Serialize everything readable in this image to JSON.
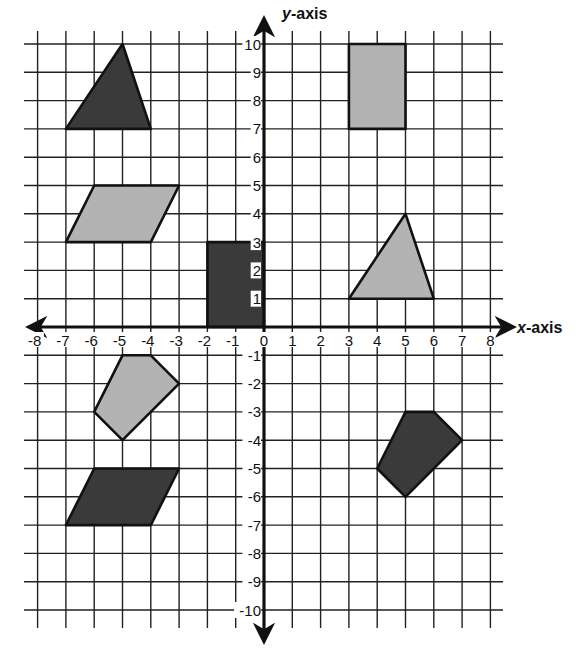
{
  "figure": {
    "x_axis_label": {
      "var": "x",
      "rest": "-axis"
    },
    "y_axis_label": {
      "var": "y",
      "rest": "-axis"
    },
    "x_range": [
      -8,
      8
    ],
    "y_range": [
      -10,
      10
    ],
    "x_tick_labels": [
      "-8",
      "-7",
      "-6",
      "-5",
      "-4",
      "-3",
      "-2",
      "-1",
      "0",
      "1",
      "2",
      "3",
      "4",
      "5",
      "6",
      "7",
      "8"
    ],
    "y_tick_labels_positive": [
      "1",
      "2",
      "3",
      "4",
      "5",
      "6",
      "7",
      "8",
      "9",
      "10"
    ],
    "y_tick_labels_negative": [
      "-1",
      "-2",
      "-3",
      "-4",
      "-5",
      "-6",
      "-7",
      "-8",
      "-9",
      "-10"
    ],
    "colors": {
      "dark_fill": "#3a3a3a",
      "light_fill": "#b3b3b3",
      "grid": "#222222"
    }
  },
  "shapes": [
    {
      "name": "dark-triangle-top-left",
      "fill": "dark",
      "vertices": [
        [
          -7,
          7
        ],
        [
          -5,
          10
        ],
        [
          -4,
          7
        ]
      ]
    },
    {
      "name": "light-rectangle-top-right",
      "fill": "light",
      "vertices": [
        [
          3,
          7
        ],
        [
          3,
          10
        ],
        [
          5,
          10
        ],
        [
          5,
          7
        ]
      ]
    },
    {
      "name": "light-parallelogram-left",
      "fill": "light",
      "vertices": [
        [
          -7,
          3
        ],
        [
          -6,
          5
        ],
        [
          -3,
          5
        ],
        [
          -4,
          3
        ]
      ]
    },
    {
      "name": "dark-rectangle-center",
      "fill": "dark",
      "vertices": [
        [
          -2,
          0
        ],
        [
          -2,
          3
        ],
        [
          0,
          3
        ],
        [
          0,
          0
        ]
      ]
    },
    {
      "name": "light-triangle-right",
      "fill": "light",
      "vertices": [
        [
          3,
          1
        ],
        [
          5,
          4
        ],
        [
          6,
          1
        ]
      ]
    },
    {
      "name": "light-pentagon-bottom-left",
      "fill": "light",
      "vertices": [
        [
          -5,
          -1
        ],
        [
          -4,
          -1
        ],
        [
          -3,
          -2
        ],
        [
          -5,
          -4
        ],
        [
          -6,
          -3
        ]
      ]
    },
    {
      "name": "dark-parallelogram-bottom-left",
      "fill": "dark",
      "vertices": [
        [
          -7,
          -7
        ],
        [
          -6,
          -5
        ],
        [
          -3,
          -5
        ],
        [
          -4,
          -7
        ]
      ]
    },
    {
      "name": "dark-pentagon-bottom-right",
      "fill": "dark",
      "vertices": [
        [
          5,
          -3
        ],
        [
          6,
          -3
        ],
        [
          7,
          -4
        ],
        [
          5,
          -6
        ],
        [
          4,
          -5
        ]
      ]
    }
  ]
}
